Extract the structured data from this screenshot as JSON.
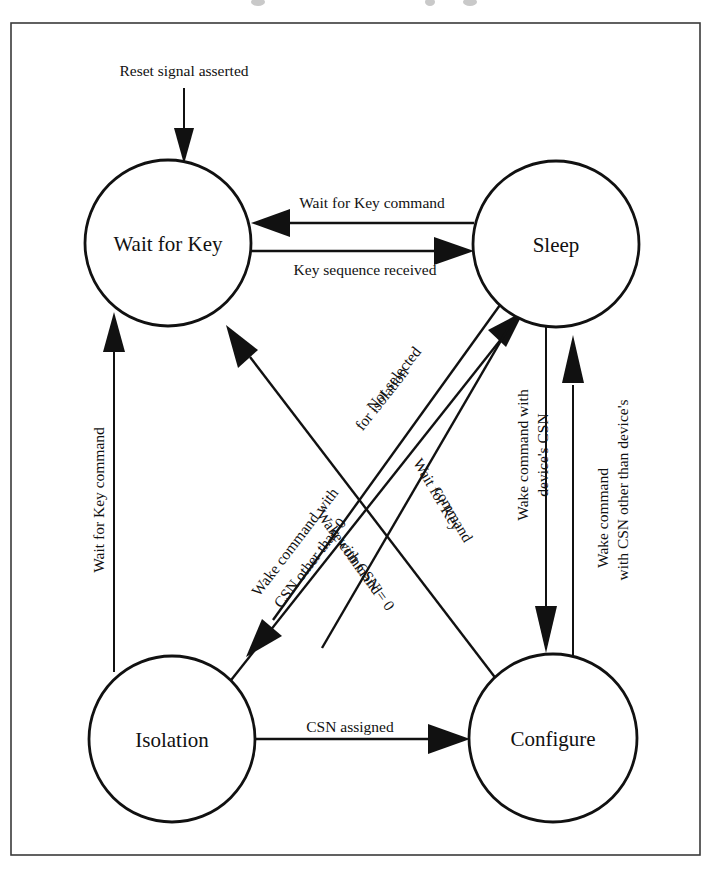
{
  "diagram": {
    "type": "state-machine",
    "frame": {
      "stroke_color": "#3a3a3a"
    },
    "ink_color": "#111111",
    "background_color": "#ffffff",
    "states": [
      {
        "id": "wait_for_key",
        "label": "Wait for Key",
        "cx": 168,
        "cy": 243,
        "r": 83
      },
      {
        "id": "sleep",
        "label": "Sleep",
        "cx": 556,
        "cy": 244,
        "r": 83
      },
      {
        "id": "isolation",
        "label": "Isolation",
        "cx": 172,
        "cy": 739,
        "r": 83
      },
      {
        "id": "configure",
        "label": "Configure",
        "cx": 553,
        "cy": 738,
        "r": 84
      }
    ],
    "entry": {
      "label": "Reset signal asserted",
      "target": "wait_for_key"
    },
    "transitions": [
      {
        "id": "sleep_to_wait",
        "from": "sleep",
        "to": "wait_for_key",
        "label": "Wait for Key command"
      },
      {
        "id": "wait_to_sleep",
        "from": "wait_for_key",
        "to": "sleep",
        "label": "Key sequence received"
      },
      {
        "id": "isolation_to_wait",
        "from": "isolation",
        "to": "wait_for_key",
        "label": "Wait for Key command"
      },
      {
        "id": "isolation_to_sleep",
        "from": "isolation",
        "to": "sleep",
        "label_line1": "Not selected",
        "label_line2": "for isolation"
      },
      {
        "id": "configure_to_wait",
        "from": "configure",
        "to": "wait_for_key",
        "label_line1": "Wake command with",
        "label_line2": "CSN other than 0"
      },
      {
        "id": "sleep_to_isolation",
        "from": "sleep",
        "to": "isolation",
        "label_line1": "Wake command",
        "label_line2": "with CSN = 0"
      },
      {
        "id": "sleep_to_configure_diag",
        "from": "sleep",
        "to": "configure",
        "label_line1": "Wait for Key",
        "label_line2": "command"
      },
      {
        "id": "sleep_to_configure",
        "from": "sleep",
        "to": "configure",
        "label_line1": "Wake command with",
        "label_line2": "device's CSN"
      },
      {
        "id": "configure_to_sleep",
        "from": "configure",
        "to": "sleep",
        "label_line1": "Wake command",
        "label_line2": "with CSN other than device's"
      },
      {
        "id": "isolation_to_configure",
        "from": "isolation",
        "to": "configure",
        "label": "CSN assigned"
      }
    ]
  }
}
